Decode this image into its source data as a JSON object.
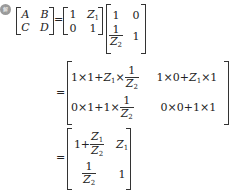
{
  "badge": {
    "label": "解"
  },
  "equation": {
    "lhs": {
      "a": "A",
      "b": "B",
      "c": "C",
      "d": "D"
    },
    "equals": "=",
    "m1": {
      "r1c1": "1",
      "r1c2": "Z",
      "r1c2_sub": "1",
      "r2c1": "0",
      "r2c2": "1"
    },
    "m2": {
      "r1c1": "1",
      "r1c2": "0",
      "r2c1_num": "1",
      "r2c1_den": "Z",
      "r2c1_den_sub": "2",
      "r2c2": "1"
    },
    "step2": {
      "r1c1_a": "1×1+",
      "r1c1_z": "Z",
      "r1c1_zsub": "1",
      "r1c1_b": "×",
      "r1c1_num": "1",
      "r1c1_den": "Z",
      "r1c1_densub": "2",
      "r1c2_a": "1×0+",
      "r1c2_z": "Z",
      "r1c2_zsub": "1",
      "r1c2_b": "×1",
      "r2c1_a": "0×1+1×",
      "r2c1_num": "1",
      "r2c1_den": "Z",
      "r2c1_densub": "2",
      "r2c2": "0×0+1×1"
    },
    "step3": {
      "r1c1_a": "1+",
      "r1c1_num": "Z",
      "r1c1_numsub": "1",
      "r1c1_den": "Z",
      "r1c1_densub": "2",
      "r1c2": "Z",
      "r1c2_sub": "1",
      "r2c1_num": "1",
      "r2c1_den": "Z",
      "r2c1_densub": "2",
      "r2c2": "1"
    }
  }
}
